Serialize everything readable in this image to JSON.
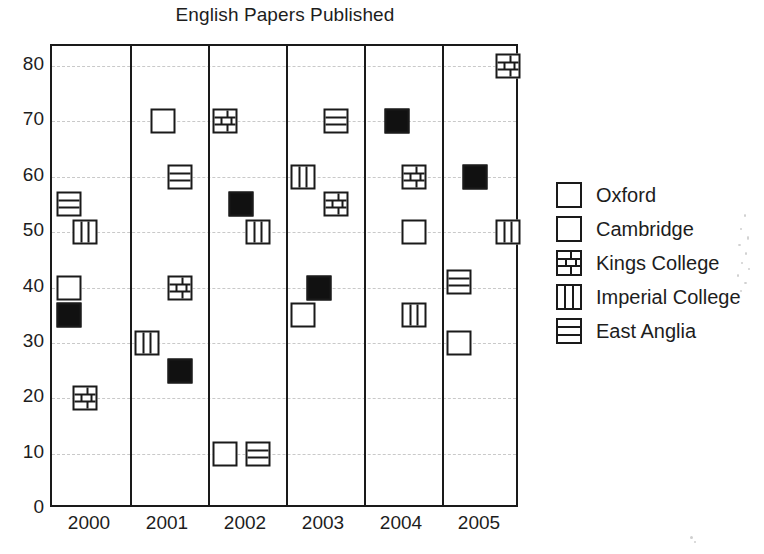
{
  "chart_data": {
    "type": "scatter",
    "title": "English Papers Published",
    "xlabel": "",
    "ylabel": "",
    "categories": [
      "2000",
      "2001",
      "2002",
      "2003",
      "2004",
      "2005"
    ],
    "ylim": [
      0,
      85
    ],
    "yticks": [
      0,
      10,
      20,
      30,
      40,
      50,
      60,
      70,
      80
    ],
    "ytick_labels": [
      "0",
      "10",
      "20",
      "30",
      "40",
      "50",
      "60",
      "70",
      "80"
    ],
    "grid": true,
    "legend_position": "right",
    "series": [
      {
        "name": "Oxford",
        "marker": "solid-square",
        "color": "#111111",
        "values": [
          35,
          25,
          55,
          40,
          70,
          60
        ]
      },
      {
        "name": "Cambridge",
        "marker": "open-square",
        "color": "#ffffff",
        "values": [
          40,
          70,
          10,
          35,
          50,
          30
        ]
      },
      {
        "name": "Kings College",
        "marker": "brick",
        "color": "#ffffff",
        "values": [
          20,
          40,
          70,
          55,
          60,
          80
        ]
      },
      {
        "name": "Imperial College",
        "marker": "vertical-lines",
        "color": "#ffffff",
        "values": [
          50,
          30,
          50,
          60,
          35,
          50
        ]
      },
      {
        "name": "East Anglia",
        "marker": "horizontal-lines",
        "color": "#ffffff",
        "values": [
          55,
          60,
          10,
          70,
          null,
          41
        ]
      }
    ],
    "points": [
      {
        "year": "2000",
        "series": "East Anglia",
        "marker": "horizontal-lines",
        "value": 55,
        "slot": 0
      },
      {
        "year": "2000",
        "series": "Imperial College",
        "marker": "vertical-lines",
        "value": 50,
        "slot": 1
      },
      {
        "year": "2000",
        "series": "Cambridge",
        "marker": "open-square",
        "value": 40,
        "slot": 0
      },
      {
        "year": "2000",
        "series": "Oxford",
        "marker": "solid-square",
        "value": 35,
        "slot": 0
      },
      {
        "year": "2000",
        "series": "Kings College",
        "marker": "brick",
        "value": 20,
        "slot": 1
      },
      {
        "year": "2001",
        "series": "Cambridge",
        "marker": "open-square",
        "value": 70,
        "slot": 1
      },
      {
        "year": "2001",
        "series": "East Anglia",
        "marker": "horizontal-lines",
        "value": 60,
        "slot": 2
      },
      {
        "year": "2001",
        "series": "Kings College",
        "marker": "brick",
        "value": 40,
        "slot": 2
      },
      {
        "year": "2001",
        "series": "Imperial College",
        "marker": "vertical-lines",
        "value": 30,
        "slot": 0
      },
      {
        "year": "2001",
        "series": "Oxford",
        "marker": "solid-square",
        "value": 25,
        "slot": 2
      },
      {
        "year": "2002",
        "series": "Kings College",
        "marker": "brick",
        "value": 70,
        "slot": 0
      },
      {
        "year": "2002",
        "series": "Oxford",
        "marker": "solid-square",
        "value": 55,
        "slot": 1
      },
      {
        "year": "2002",
        "series": "Imperial College",
        "marker": "vertical-lines",
        "value": 50,
        "slot": 2
      },
      {
        "year": "2002",
        "series": "Cambridge",
        "marker": "open-square",
        "value": 10,
        "slot": 0
      },
      {
        "year": "2002",
        "series": "East Anglia",
        "marker": "horizontal-lines",
        "value": 10,
        "slot": 2
      },
      {
        "year": "2003",
        "series": "East Anglia",
        "marker": "horizontal-lines",
        "value": 70,
        "slot": 2
      },
      {
        "year": "2003",
        "series": "Imperial College",
        "marker": "vertical-lines",
        "value": 60,
        "slot": 0
      },
      {
        "year": "2003",
        "series": "Kings College",
        "marker": "brick",
        "value": 55,
        "slot": 2
      },
      {
        "year": "2003",
        "series": "Oxford",
        "marker": "solid-square",
        "value": 40,
        "slot": 1
      },
      {
        "year": "2003",
        "series": "Cambridge",
        "marker": "open-square",
        "value": 35,
        "slot": 0
      },
      {
        "year": "2004",
        "series": "Oxford",
        "marker": "solid-square",
        "value": 70,
        "slot": 1
      },
      {
        "year": "2004",
        "series": "Kings College",
        "marker": "brick",
        "value": 60,
        "slot": 2
      },
      {
        "year": "2004",
        "series": "Cambridge",
        "marker": "open-square",
        "value": 50,
        "slot": 2
      },
      {
        "year": "2004",
        "series": "Imperial College",
        "marker": "vertical-lines",
        "value": 35,
        "slot": 2
      },
      {
        "year": "2005",
        "series": "Kings College",
        "marker": "brick",
        "value": 80,
        "slot": 3
      },
      {
        "year": "2005",
        "series": "Oxford",
        "marker": "solid-square",
        "value": 60,
        "slot": 1
      },
      {
        "year": "2005",
        "series": "Imperial College",
        "marker": "vertical-lines",
        "value": 50,
        "slot": 3
      },
      {
        "year": "2005",
        "series": "East Anglia",
        "marker": "horizontal-lines",
        "value": 41,
        "slot": 0
      },
      {
        "year": "2005",
        "series": "Cambridge",
        "marker": "open-square",
        "value": 30,
        "slot": 0
      }
    ]
  },
  "legend": {
    "items": [
      {
        "label": "Oxford",
        "marker": "solid-square"
      },
      {
        "label": "Cambridge",
        "marker": "open-square"
      },
      {
        "label": "Kings College",
        "marker": "brick"
      },
      {
        "label": "Imperial College",
        "marker": "vertical-lines"
      },
      {
        "label": "East Anglia",
        "marker": "horizontal-lines"
      }
    ]
  }
}
